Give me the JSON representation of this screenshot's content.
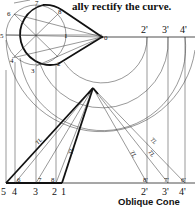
{
  "header_text": "ally rectify the curve.",
  "caption": "Oblique Cone",
  "base_view": {
    "points": [
      "0",
      "1",
      "2",
      "3",
      "4",
      "5",
      "6",
      "7",
      "8"
    ]
  },
  "development": {
    "arc_labels": [
      "2'",
      "3'",
      "4'"
    ],
    "bottom_left_labels": [
      "5",
      "4",
      "3",
      "2",
      "1"
    ],
    "bottom_right_labels": [
      "2'",
      "3'",
      "4'"
    ],
    "inner_labels_left": [
      "6",
      "7",
      "8"
    ],
    "inner_labels_right": [
      "8'",
      "7'",
      "6'"
    ],
    "true_length_label": "TL"
  }
}
